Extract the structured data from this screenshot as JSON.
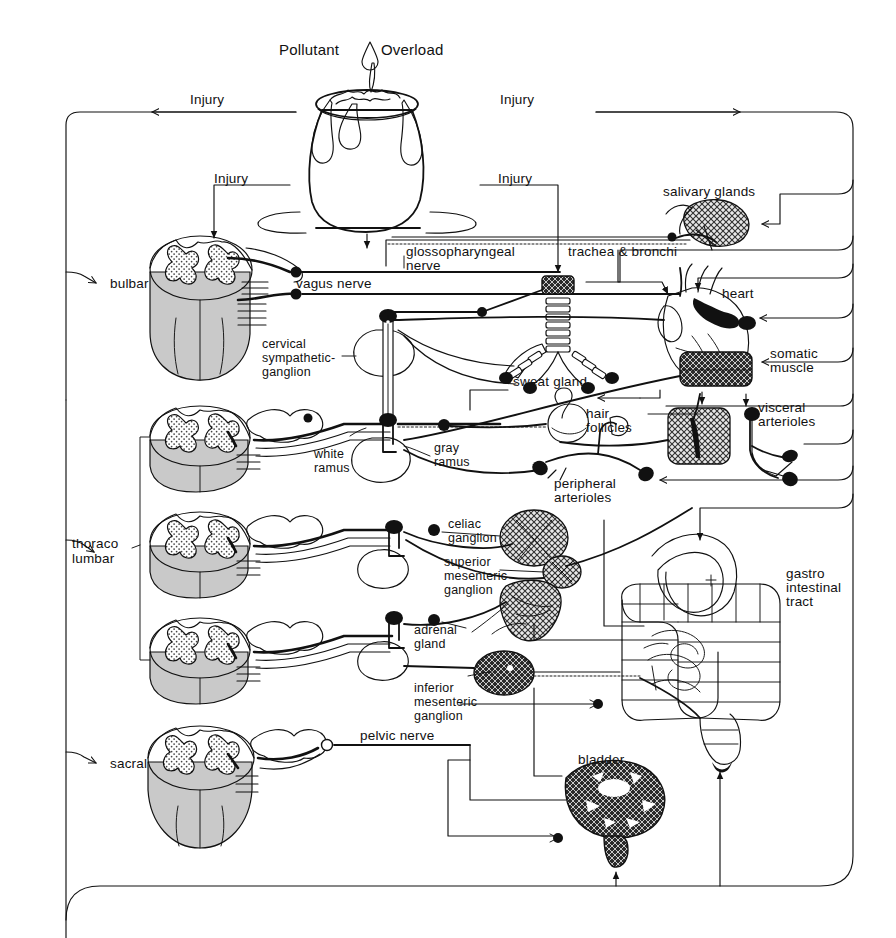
{
  "diagram": {
    "title": "Pollutant Overload",
    "title_icon": "droplet-icon",
    "background_color": "#ffffff",
    "line_color": "#111111",
    "injury_labels": [
      {
        "id": "injury-top-left",
        "text": "Injury"
      },
      {
        "id": "injury-top-right",
        "text": "Injury"
      },
      {
        "id": "injury-mid-left",
        "text": "Injury"
      },
      {
        "id": "injury-mid-right",
        "text": "Injury"
      }
    ],
    "spinal_levels": [
      {
        "id": "bulbar",
        "label": "bulbar"
      },
      {
        "id": "thoraco-lumbar",
        "label": "thoraco\nlumbar",
        "line1": "thoraco",
        "line2": "lumbar"
      },
      {
        "id": "sacral",
        "label": "sacral"
      }
    ],
    "nerve_labels": [
      {
        "id": "vagus-nerve",
        "text": "vagus nerve"
      },
      {
        "id": "glossopharyngeal-nerve",
        "line1": "glossopharyngeal",
        "line2": "nerve"
      },
      {
        "id": "pelvic-nerve",
        "text": "pelvic nerve"
      },
      {
        "id": "white-ramus",
        "line1": "white",
        "line2": "ramus"
      },
      {
        "id": "gray-ramus",
        "line1": "gray",
        "line2": "ramus"
      }
    ],
    "ganglia": [
      {
        "id": "cervical-sympathetic-ganglion",
        "line1": "cervical",
        "line2": "sympathetic-",
        "line3": "ganglion"
      },
      {
        "id": "celiac-ganglion",
        "line1": "celiac",
        "line2": "ganglion"
      },
      {
        "id": "superior-mesenteric-ganglion",
        "line1": "superior",
        "line2": "mesenteric",
        "line3": "ganglion"
      },
      {
        "id": "inferior-mesenteric-ganglion",
        "line1": "inferior",
        "line2": "mesenteric",
        "line3": "ganglion"
      }
    ],
    "organs": [
      {
        "id": "salivary-glands",
        "text": "salivary glands"
      },
      {
        "id": "trachea-bronchi",
        "text": "trachea & bronchi"
      },
      {
        "id": "heart",
        "text": "heart"
      },
      {
        "id": "somatic-muscle",
        "line1": "somatic",
        "line2": "muscle"
      },
      {
        "id": "sweat-gland",
        "text": "sweat gland"
      },
      {
        "id": "hair-follicles",
        "line1": "hair",
        "line2": "follicles"
      },
      {
        "id": "visceral-arterioles",
        "line1": "visceral",
        "line2": "arterioles"
      },
      {
        "id": "peripheral-arterioles",
        "line1": "peripheral",
        "line2": "arterioles"
      },
      {
        "id": "adrenal-gland",
        "line1": "adrenal",
        "line2": "gland"
      },
      {
        "id": "gastro-intestinal-tract",
        "line1": "gastro",
        "line2": "intestinal",
        "line3": "tract"
      },
      {
        "id": "bladder",
        "text": "bladder"
      }
    ]
  }
}
